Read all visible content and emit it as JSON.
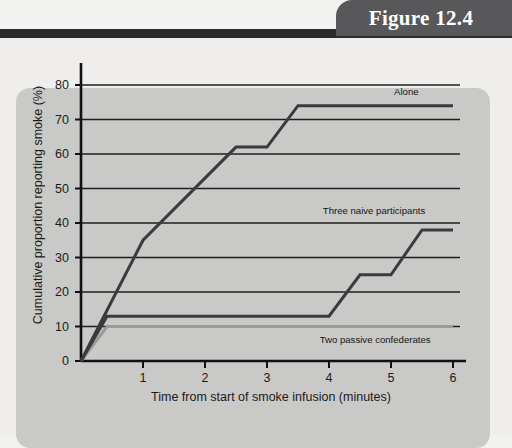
{
  "figure": {
    "tab_label": "Figure 12.4"
  },
  "chart_data": {
    "type": "line",
    "title": "",
    "xlabel": "Time from start of smoke infusion (minutes)",
    "ylabel": "Cumulative proportion reporting smoke (%)",
    "xlim": [
      0,
      6.25
    ],
    "ylim": [
      0,
      85
    ],
    "xticks": [
      "1",
      "2",
      "3",
      "4",
      "5",
      "6"
    ],
    "xtick_values": [
      1,
      2,
      3,
      4,
      5,
      6
    ],
    "yticks": [
      "0",
      "10",
      "20",
      "30",
      "40",
      "50",
      "60",
      "70",
      "80"
    ],
    "ytick_values": [
      0,
      10,
      20,
      30,
      40,
      50,
      60,
      70,
      80
    ],
    "grid": "horizontal",
    "legend_position": "inline-end-of-line",
    "series": [
      {
        "name": "Alone",
        "color": "#3b3b3d",
        "width": 3.0,
        "points": [
          [
            0,
            0
          ],
          [
            1,
            35
          ],
          [
            2.5,
            62
          ],
          [
            3.0,
            62
          ],
          [
            3.5,
            74
          ],
          [
            6.0,
            74
          ]
        ],
        "label": "Alone",
        "label_x": 5.05,
        "label_y": 78
      },
      {
        "name": "Three naive participants",
        "color": "#3b3b3d",
        "width": 3.0,
        "points": [
          [
            0,
            0
          ],
          [
            0.42,
            13
          ],
          [
            4.0,
            13
          ],
          [
            4.5,
            25
          ],
          [
            5.0,
            25
          ],
          [
            5.5,
            38
          ],
          [
            6.0,
            38
          ]
        ],
        "label": "Three naive participants",
        "label_x": 3.9,
        "label_y": 43.5
      },
      {
        "name": "Two passive confederates",
        "color": "#9a9a98",
        "width": 3.0,
        "points": [
          [
            0,
            0
          ],
          [
            0.42,
            10
          ],
          [
            6.0,
            10
          ]
        ],
        "label": "Two passive confederates",
        "label_x": 3.85,
        "label_y": 6.0
      }
    ]
  }
}
